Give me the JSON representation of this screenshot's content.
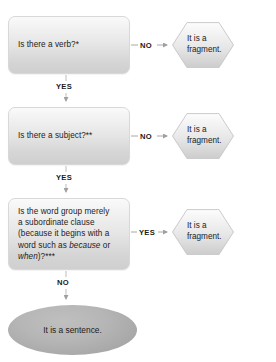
{
  "diagram": {
    "colors": {
      "box_fill_top": "#fafafa",
      "box_fill_bottom": "#cfcfcf",
      "box_border": "#d8d8d8",
      "hexagon_fill_top": "#fdfdfd",
      "hexagon_fill_bottom": "#cccccc",
      "ellipse_fill": "#b6b6b6",
      "connector": "#9a9a9a",
      "text": "#222222",
      "background": "#ffffff"
    },
    "decisions": [
      {
        "id": "verb",
        "text": "Is there a verb?*",
        "no_label": "NO",
        "yes_label": "YES",
        "no_result": "It is a\nfragment."
      },
      {
        "id": "subject",
        "text": "Is there a subject?**",
        "no_label": "NO",
        "yes_label": "YES",
        "no_result": "It is a\nfragment."
      },
      {
        "id": "subordinate-clause",
        "text_line_1": "Is the word group merely",
        "text_line_2": "a subordinate clause",
        "text_line_3": "(because it begins with a",
        "text_line_4_pre": "word such as ",
        "text_line_4_em_a": "because",
        "text_line_4_mid": " or",
        "text_line_5_em_b": "when",
        "text_line_5_post": ")?***",
        "yes_label": "YES",
        "no_label": "NO",
        "yes_result": "It is a\nfragment."
      }
    ],
    "outcomes": {
      "fragment_line_1": "It is a",
      "fragment_line_2": "fragment.",
      "sentence": "It is a sentence."
    },
    "labels": {
      "no": "NO",
      "yes": "YES"
    }
  }
}
